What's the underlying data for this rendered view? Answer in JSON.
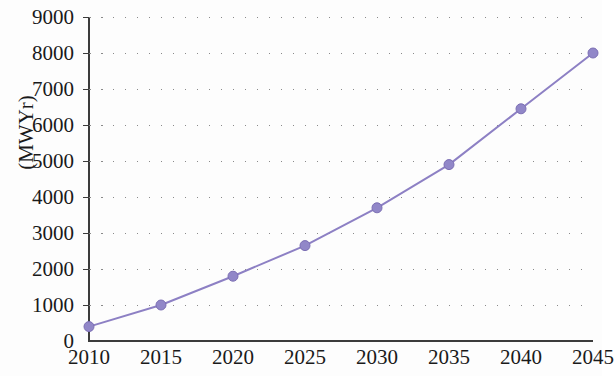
{
  "chart_data": {
    "type": "line",
    "title": "",
    "subtitle": "",
    "xlabel": "",
    "ylabel": "(MWYr)",
    "x": [
      2010,
      2015,
      2020,
      2025,
      2030,
      2035,
      2040,
      2045
    ],
    "categories": [
      "2010",
      "2015",
      "2020",
      "2025",
      "2030",
      "2035",
      "2040",
      "2045"
    ],
    "values": [
      400,
      1000,
      1800,
      2650,
      3700,
      4900,
      6450,
      8000
    ],
    "series": [
      {
        "name": "",
        "values": [
          400,
          1000,
          1800,
          2650,
          3700,
          4900,
          6450,
          8000
        ]
      }
    ],
    "xlim": [
      2010,
      2045
    ],
    "ylim": [
      0,
      9000
    ],
    "ytick_labels": [
      "0",
      "1000",
      "2000",
      "3000",
      "4000",
      "5000",
      "6000",
      "7000",
      "8000",
      "9000"
    ],
    "ytick_values": [
      0,
      1000,
      2000,
      3000,
      4000,
      5000,
      6000,
      7000,
      8000,
      9000
    ],
    "xtick_labels": [
      "2010",
      "2015",
      "2020",
      "2025",
      "2030",
      "2035",
      "2040",
      "2045"
    ],
    "xtick_values": [
      2010,
      2015,
      2020,
      2025,
      2030,
      2035,
      2040,
      2045
    ],
    "grid": "horizontal-dotted",
    "legend": "none",
    "annotations": [],
    "colors": {
      "line": "#8d80c4",
      "marker": "#9187c8",
      "marker_edge": "#7c6fb4",
      "grid": "#8a8a8a",
      "axis": "#3c3c3c",
      "text": "#1a1a1a",
      "background": "#fdfdfd"
    },
    "style": {
      "line_width": 2,
      "marker_radius": 5,
      "marker_shape": "circle"
    }
  }
}
